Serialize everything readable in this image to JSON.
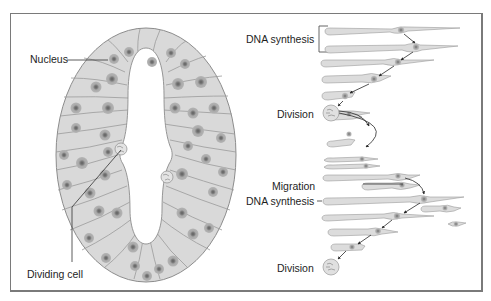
{
  "figure": {
    "left_panel": {
      "title": "Neural tube cross-section",
      "labels": {
        "nucleus": "Nucleus",
        "dividing_cell": "Dividing cell"
      }
    },
    "right_panel": {
      "title": "Interkinetic nuclear migration",
      "labels": {
        "dna_synthesis_1": "DNA synthesis",
        "division_1": "Division",
        "migration": "Migration",
        "dna_synthesis_2": "DNA synthesis",
        "division_2": "Division"
      }
    },
    "colors": {
      "frame": "#7a7a7a",
      "tissue_fill": "#d9d9d9",
      "tissue_stroke": "#8c8c8c",
      "cell_line": "#9a9a9a",
      "nucleus_outer": "#ababab",
      "nucleus_inner": "#6e6e6e",
      "lumen": "#ffffff",
      "arrow": "#333333",
      "text": "#1e1e1e"
    }
  }
}
